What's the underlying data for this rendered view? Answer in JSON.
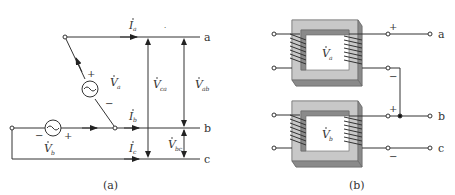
{
  "figure_a": {
    "caption": "(a)",
    "terminals": {
      "a": "a",
      "b": "b",
      "c": "c"
    },
    "currents": {
      "Ia": "I",
      "Ia_sub": "a",
      "Ib": "I",
      "Ib_sub": "b",
      "Ic": "I",
      "Ic_sub": "c"
    },
    "sources": {
      "Va": {
        "label": "V",
        "sub": "a",
        "plus": "+",
        "minus": "−"
      },
      "Vb": {
        "label": "V",
        "sub": "b",
        "plus": "+",
        "minus": "−"
      }
    },
    "line_voltages": {
      "Vca": {
        "label": "V",
        "sub": "ca"
      },
      "Vab": {
        "label": "V",
        "sub": "ab"
      },
      "Vbc": {
        "label": "V",
        "sub": "bc"
      }
    }
  },
  "figure_b": {
    "caption": "(b)",
    "terminals": {
      "a": "a",
      "b": "b",
      "c": "c"
    },
    "transformers": [
      {
        "label": "V",
        "sub": "a",
        "plus": "+",
        "minus": "−"
      },
      {
        "label": "V",
        "sub": "b",
        "plus": "+",
        "minus": "−"
      }
    ],
    "colors": {
      "core_light": "#c8c8c8",
      "core_mid": "#a8a8a8",
      "core_dark": "#8a8a8a",
      "wire": "#333333"
    }
  }
}
